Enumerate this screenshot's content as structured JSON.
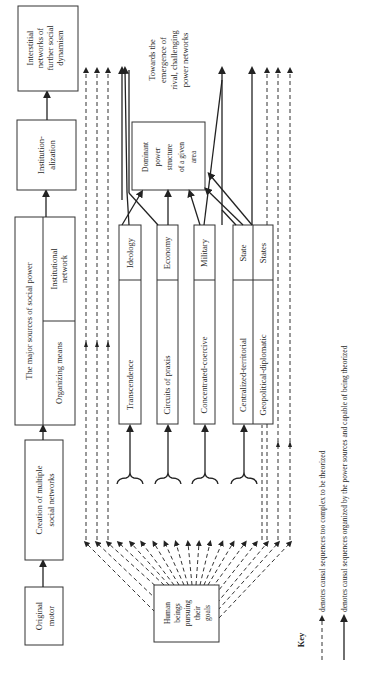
{
  "diagram": {
    "boxes": {
      "original_motor": [
        "Original",
        "motor"
      ],
      "creation": [
        "Creation of multiple",
        "social networks"
      ],
      "major_sources_title": "The major sources of social power",
      "organizing_means": "Organizing means",
      "institutional_network": [
        "Institutional",
        "network"
      ],
      "institutionalization": [
        "Institution-",
        "alization"
      ],
      "interstitial": [
        "Interstitial",
        "networks of",
        "further social",
        "dynamism"
      ],
      "human_beings": [
        "Human",
        "beings",
        "pursuing",
        "their",
        "goals"
      ],
      "dominant_power": [
        "Dominant",
        "power",
        "structure",
        "of a given",
        "area"
      ]
    },
    "power_sources": [
      {
        "means": "Transcendence",
        "network": "Ideology"
      },
      {
        "means": "Circuits of praxis",
        "network": "Economy"
      },
      {
        "means": "Concentrated-coercive",
        "network": "Military"
      },
      {
        "means": "Centralized-territorial",
        "network": "State"
      },
      {
        "means": "Geopolitical-diplomatic",
        "network": "States"
      }
    ],
    "annotation": [
      "Towards the",
      "emergence of",
      "rival, challenging",
      "power networks"
    ]
  },
  "key": {
    "title": "Key",
    "items": [
      {
        "style": "dashed",
        "label": "denotes causal sequences too complex to be theorized"
      },
      {
        "style": "solid",
        "label": "denotes causal sequences organized by the power sources and capable of being theorized"
      }
    ]
  }
}
